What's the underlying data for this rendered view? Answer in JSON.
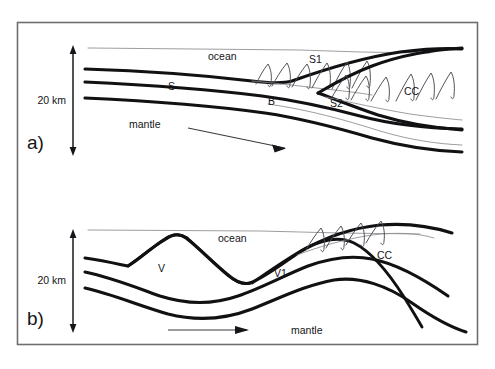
{
  "figure": {
    "background_color": "#ffffff",
    "frame_color": "#6e6e72",
    "line_color": "#111114",
    "thin_line_color": "#8b8b90"
  },
  "panel_a": {
    "panel_label": "a)",
    "scale_label": "20 km",
    "labels": {
      "ocean": "ocean",
      "mantle": "mantle",
      "sediment": "S",
      "wedge_one": "S1",
      "wedge_two": "S2",
      "backstop": "B",
      "continental_crust": "CC"
    }
  },
  "panel_b": {
    "panel_label": "b)",
    "scale_label": "20 km",
    "labels": {
      "ocean": "ocean",
      "mantle": "mantle",
      "volcano": "V",
      "volcanic_arc": "V1",
      "continental_crust": "CC"
    }
  }
}
